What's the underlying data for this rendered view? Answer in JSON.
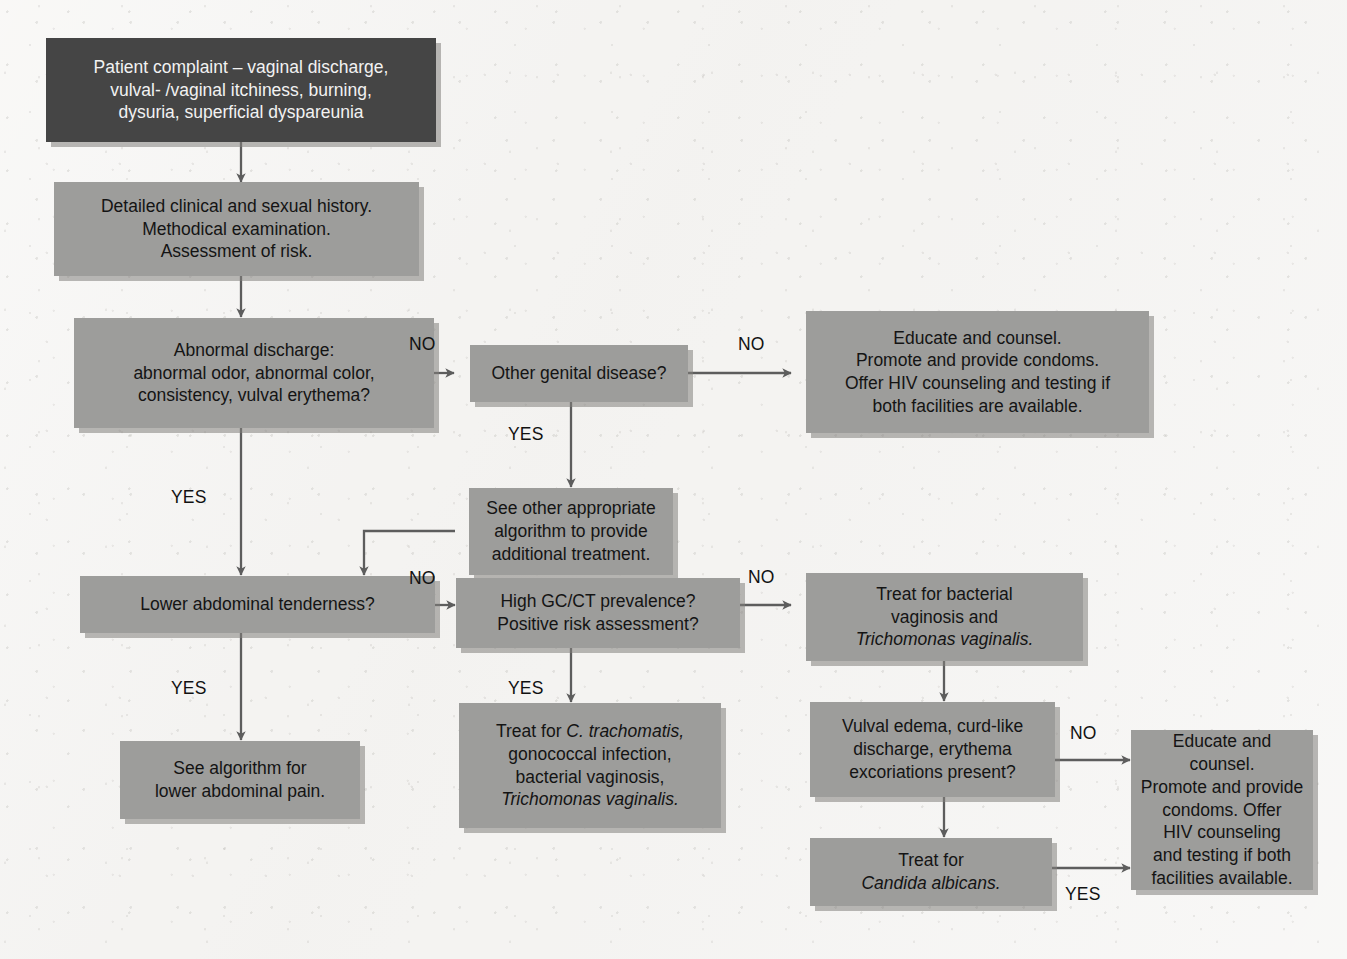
{
  "diagram": {
    "palette": {
      "page_background": "#f4f3f1",
      "node_fill": "#9d9d9b",
      "node_fill_dark": "#454545",
      "node_text": "#141414",
      "node_text_dark": "#f2f2f2",
      "edge_stroke": "#5d5d5d",
      "shadow": "#82807c"
    },
    "nodes": [
      {
        "id": "patient-complaint",
        "style": "dark",
        "lines": [
          "Patient complaint – vaginal discharge,",
          "vulval- /vaginal itchiness, burning,",
          "dysuria, superficial dyspareunia"
        ]
      },
      {
        "id": "history-exam",
        "style": "light",
        "lines": [
          "Detailed clinical and sexual history.",
          "Methodical examination.",
          "Assessment of risk."
        ]
      },
      {
        "id": "abnormal-discharge",
        "style": "light",
        "lines": [
          "Abnormal discharge:",
          "abnormal odor, abnormal color,",
          "consistency, vulval erythema?"
        ]
      },
      {
        "id": "other-genital-disease",
        "style": "light",
        "lines": [
          "Other genital disease?"
        ]
      },
      {
        "id": "educate-counsel-top",
        "style": "light",
        "lines": [
          "Educate and counsel.",
          "Promote and provide condoms.",
          "Offer HIV counseling and testing if",
          "both facilities are available."
        ]
      },
      {
        "id": "see-other-algorithm",
        "style": "light",
        "lines": [
          "See other appropriate",
          "algorithm to provide",
          "additional treatment."
        ]
      },
      {
        "id": "lower-abdominal-tenderness",
        "style": "light",
        "lines": [
          "Lower abdominal tenderness?"
        ]
      },
      {
        "id": "high-gc-ct",
        "style": "light",
        "lines": [
          "High GC/CT prevalence?",
          "Positive risk assessment?"
        ]
      },
      {
        "id": "treat-bv-tv",
        "style": "light",
        "html": "Treat for bacterial<br>vaginosis and<br><i>Trichomonas vaginalis.</i>"
      },
      {
        "id": "see-algorithm-lower-abdominal-pain",
        "style": "light",
        "lines": [
          "See algorithm for",
          "lower abdominal pain."
        ]
      },
      {
        "id": "treat-ct-gc-bv-tv",
        "style": "light",
        "html": "Treat for <i>C. trachomatis,</i><br>gonococcal infection,<br>bacterial vaginosis,<br><i>Trichomonas vaginalis.</i>"
      },
      {
        "id": "vulval-edema",
        "style": "light",
        "lines": [
          "Vulval edema, curd-like",
          "discharge, erythema",
          "excoriations present?"
        ]
      },
      {
        "id": "educate-counsel-bottom",
        "style": "light",
        "lines": [
          "Educate and counsel.",
          "Promote and provide",
          "condoms. Offer",
          "HIV counseling",
          "and testing if both",
          "facilities available."
        ]
      },
      {
        "id": "treat-candida",
        "style": "light",
        "html": "Treat for<br><i>Candida albicans.</i>"
      }
    ],
    "edge_labels": [
      {
        "id": "no-abnormal-discharge",
        "text": "NO"
      },
      {
        "id": "no-other-genital",
        "text": "NO"
      },
      {
        "id": "yes-other-genital",
        "text": "YES"
      },
      {
        "id": "yes-abnormal-discharge",
        "text": "YES"
      },
      {
        "id": "no-lower-abdominal",
        "text": "NO"
      },
      {
        "id": "yes-lower-abdominal",
        "text": "YES"
      },
      {
        "id": "no-high-gc-ct",
        "text": "NO"
      },
      {
        "id": "yes-high-gc-ct",
        "text": "YES"
      },
      {
        "id": "no-vulval-edema",
        "text": "NO"
      },
      {
        "id": "yes-treat-candida",
        "text": "YES"
      }
    ]
  }
}
